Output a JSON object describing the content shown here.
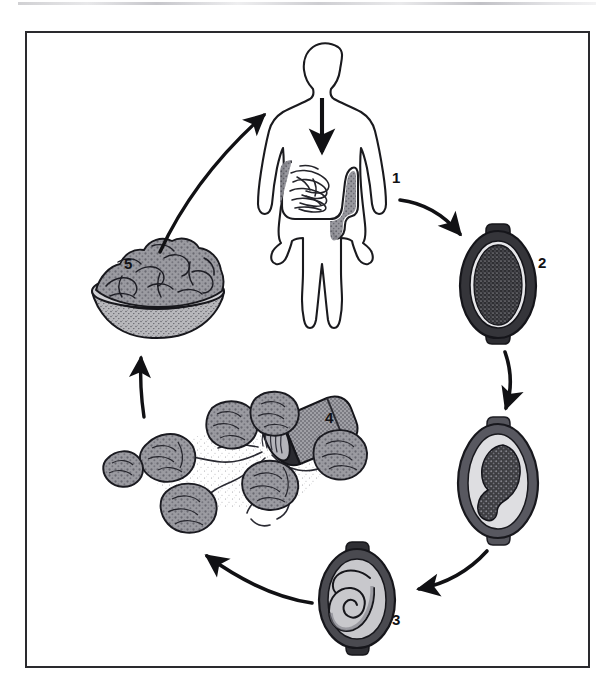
{
  "figure": {
    "domain": "Diagram",
    "kind": "parasite-life-cycle",
    "frame": {
      "border_color": "#2a2a2e",
      "background_color": "#ffffff",
      "x": 25,
      "y": 31,
      "width": 565,
      "height": 637
    },
    "scan_artifact": {
      "present": true,
      "color": "#aaaaaf",
      "y": 2
    }
  },
  "palette": {
    "ink": "#111114",
    "outline": "#1a1a1e",
    "shell_dark": "#3a3a3e",
    "shell_mid": "#6e6e72",
    "fill_light": "#d9d9dc",
    "fill_mid": "#9a9a9e",
    "fill_dark": "#4a4a4e",
    "white": "#ffffff"
  },
  "stages": [
    {
      "number": "1",
      "name": "human-host",
      "caption": "Adult worms in human large intestine",
      "label_x": 392,
      "label_y": 170
    },
    {
      "number": "2",
      "name": "unembryonated-egg",
      "caption": "Unembryonated egg passed in feces",
      "label_x": 538,
      "label_y": 255
    },
    {
      "number": "3",
      "name": "embryonated-infective-egg",
      "caption": "Embryonated egg containing coiled larva, infective stage",
      "label_x": 392,
      "label_y": 612
    },
    {
      "number": "4",
      "name": "soil-contamination",
      "caption": "Eggs deposited in soil contaminating vegetable crops",
      "label_x": 325,
      "label_y": 410
    },
    {
      "number": "5",
      "name": "contaminated-salad",
      "caption": "Contaminated salad vegetables ingested",
      "label_x": 124,
      "label_y": 256
    }
  ],
  "intermediate": {
    "number": "",
    "name": "two-cell-cleaving-egg",
    "caption": "Egg undergoing cleavage and development in soil"
  },
  "arrows": [
    {
      "name": "arrow-human-to-egg2",
      "from": "1",
      "to": "2",
      "direction": "down-right"
    },
    {
      "name": "arrow-egg2-to-cleaving",
      "from": "2",
      "to": "developing-egg",
      "direction": "down"
    },
    {
      "name": "arrow-cleaving-to-egg3",
      "from": "developing-egg",
      "to": "3",
      "direction": "down-left"
    },
    {
      "name": "arrow-egg3-to-soil",
      "from": "3",
      "to": "4",
      "direction": "left-up"
    },
    {
      "name": "arrow-soil-to-salad",
      "from": "4",
      "to": "5",
      "direction": "up"
    },
    {
      "name": "arrow-salad-to-human",
      "from": "5",
      "to": "1",
      "direction": "up-right"
    },
    {
      "name": "arrow-ingestion-into-gut",
      "from": "mouth",
      "to": "intestine",
      "direction": "down"
    }
  ]
}
